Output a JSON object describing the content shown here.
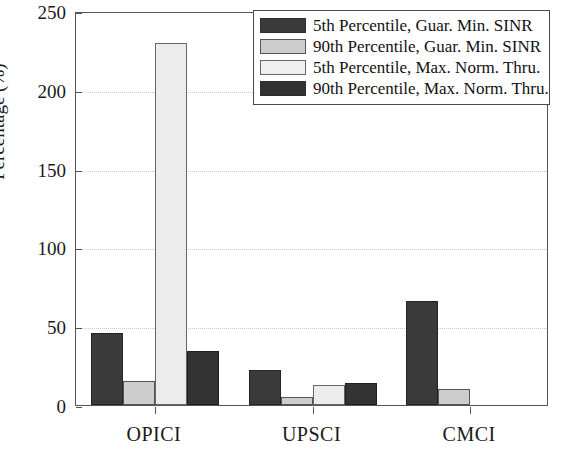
{
  "chart_data": {
    "type": "bar",
    "title": "",
    "xlabel": "",
    "ylabel": "Percentage (%)",
    "ylim": [
      0,
      250
    ],
    "yticks": [
      0,
      50,
      100,
      150,
      200,
      250
    ],
    "ytick_labels": [
      "0",
      "50",
      "100",
      "150",
      "200",
      "250"
    ],
    "grid": true,
    "grid_axis": "y",
    "legend_position": "upper right",
    "categories": [
      "OPICI",
      "UPSCI",
      "CMCI"
    ],
    "series": [
      {
        "name": "5th Percentile, Guar. Min. SINR",
        "color": "#3a3a3a",
        "values": [
          46,
          22,
          66
        ]
      },
      {
        "name": "90th Percentile, Guar. Min. SINR",
        "color": "#cdcdcd",
        "values": [
          15,
          5,
          10
        ]
      },
      {
        "name": "5th Percentile, Max. Norm. Thru.",
        "color": "#ececec",
        "values": [
          230,
          13,
          0
        ]
      },
      {
        "name": "90th Percentile, Max. Norm. Thru.",
        "color": "#333333",
        "values": [
          34,
          14,
          0
        ]
      }
    ]
  }
}
